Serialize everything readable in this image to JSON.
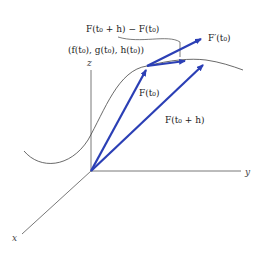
{
  "diagram": {
    "axes": {
      "x_label": "x",
      "y_label": "y",
      "z_label": "z"
    },
    "labels": {
      "point": "(f(t₀), g(t₀), h(t₀))",
      "secant": "F(t₀ + h) − F(t₀)",
      "tangent": "F′(t₀)",
      "position_t0": "F(t₀)",
      "position_t0h": "F(t₀ + h)"
    },
    "colors": {
      "vector": "#2b3fb5",
      "curve": "#444444",
      "axis": "#555555"
    }
  }
}
